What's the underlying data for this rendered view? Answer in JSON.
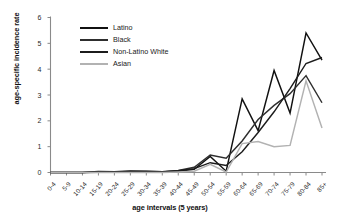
{
  "chart_data": {
    "type": "line",
    "title": "",
    "xlabel": "age intervals (5 years)",
    "ylabel": "age-specific incidence rate",
    "ylim": [
      0,
      6
    ],
    "yticks": [
      "0",
      "1",
      "2",
      "3",
      "4",
      "5",
      "6"
    ],
    "grid": false,
    "legend_position": "upper-left-inside",
    "categories": [
      "0-4",
      "5-9",
      "10-14",
      "15-19",
      "20-24",
      "25-29",
      "30-34",
      "35-39",
      "40-44",
      "45-49",
      "50-54",
      "55-59",
      "60-64",
      "65-69",
      "70-74",
      "75-79",
      "80-84",
      "85+"
    ],
    "series": [
      {
        "name": "Latino",
        "color": "#111111",
        "values": [
          0,
          0,
          0,
          0.04,
          0.03,
          0.06,
          0.05,
          0.03,
          0.05,
          0.12,
          0.62,
          0.05,
          2.85,
          1.62,
          3.95,
          2.3,
          5.4,
          4.35
        ]
      },
      {
        "name": "Black",
        "color": "#2e2e2e",
        "values": [
          0,
          0,
          0,
          0.02,
          0.02,
          0.04,
          0.04,
          0.03,
          0.08,
          0.2,
          0.68,
          0.55,
          1.22,
          2.05,
          2.6,
          3.05,
          3.75,
          2.7
        ]
      },
      {
        "name": "Non-Latino White",
        "color": "#1c1c1c",
        "values": [
          0,
          0,
          0,
          0.01,
          0.02,
          0.03,
          0.03,
          0.02,
          0.07,
          0.15,
          0.38,
          0.27,
          0.8,
          1.55,
          2.35,
          3.25,
          4.22,
          4.45
        ]
      },
      {
        "name": "Asian",
        "color": "#b2b2b2",
        "values": [
          0,
          0,
          0,
          0,
          0,
          0,
          0,
          0,
          0.02,
          0.05,
          0.32,
          0.02,
          1.12,
          1.2,
          1.0,
          1.05,
          3.55,
          1.72
        ]
      }
    ]
  },
  "axes": {
    "y_title": "age-specific incidence rate",
    "x_title": "age intervals (5 years)"
  },
  "legend": {
    "items": [
      {
        "label": "Latino"
      },
      {
        "label": "Black"
      },
      {
        "label": "Non-Latino White"
      },
      {
        "label": "Asian"
      }
    ]
  }
}
